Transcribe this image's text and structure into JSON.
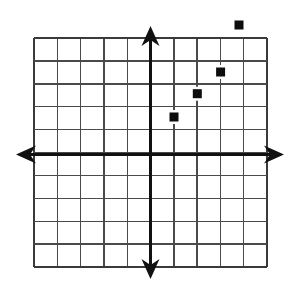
{
  "figure": {
    "type": "coordinate-grid",
    "background_color": "#ffffff"
  },
  "grid": {
    "columns": 10,
    "rows": 10,
    "cell_size_px": 23.3,
    "left_px": 34,
    "top_px": 38,
    "right_px": 267,
    "bottom_px": 267,
    "line_color": "#4a4a4a",
    "border_color": "#3a3a3a",
    "line_width_px": 1.4
  },
  "axes": {
    "color": "#111111",
    "line_width_px": 3,
    "origin_x_px": 150.5,
    "origin_y_px": 154.5,
    "x_axis": {
      "label": "x-axis",
      "left_arrow_tip_px": 16,
      "right_arrow_tip_px": 284,
      "range_units": [
        -5,
        5
      ]
    },
    "y_axis": {
      "label": "y-axis",
      "top_arrow_tip_px": 26,
      "bottom_arrow_tip_px": 279,
      "range_units": [
        -5,
        5
      ]
    }
  },
  "chart_data": {
    "type": "scatter",
    "title": "",
    "xlabel": "",
    "ylabel": "",
    "xlim": [
      -5,
      5
    ],
    "ylim": [
      -5,
      5
    ],
    "grid": true,
    "legend": false,
    "marker": "square",
    "marker_color": "#0d0d0d",
    "marker_size_px": 9,
    "points": [
      {
        "label": "point-1",
        "x": 1,
        "y": 2,
        "px": 174,
        "py": 117
      },
      {
        "label": "point-2",
        "x": 2,
        "y": 3,
        "px": 197.3,
        "py": 93.7
      },
      {
        "label": "point-3",
        "x": 3,
        "y": 3.5,
        "px": 220.6,
        "py": 72
      },
      {
        "label": "point-4",
        "x": 3.8,
        "y": 5.6,
        "px": 239,
        "py": 25
      }
    ]
  }
}
